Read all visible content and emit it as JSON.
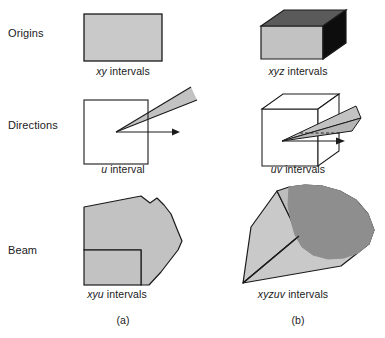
{
  "figure": {
    "width": 385,
    "height": 338,
    "background": "#ffffff"
  },
  "row_labels": [
    {
      "id": "origins",
      "text": "Origins",
      "x": 8,
      "y": 34
    },
    {
      "id": "directions",
      "text": "Directions",
      "x": 8,
      "y": 126
    },
    {
      "id": "beam",
      "text": "Beam",
      "x": 8,
      "y": 251
    }
  ],
  "captions": [
    {
      "id": "xy-intervals",
      "italic": "xy",
      "rest": " intervals",
      "cx": 123,
      "y": 72,
      "row": "origins",
      "column": "a"
    },
    {
      "id": "xyz-intervals",
      "italic": "xyz",
      "rest": " intervals",
      "cx": 298,
      "y": 72,
      "row": "origins",
      "column": "b"
    },
    {
      "id": "u-interval",
      "italic": "u",
      "rest": " interval",
      "cx": 123,
      "y": 170,
      "row": "directions",
      "column": "a"
    },
    {
      "id": "uv-intervals",
      "italic": "uv",
      "rest": " intervals",
      "cx": 298,
      "y": 170,
      "row": "directions",
      "column": "b"
    },
    {
      "id": "xyu-intervals",
      "italic": "xyu",
      "rest": " intervals",
      "cx": 117,
      "y": 295,
      "row": "beam",
      "column": "a"
    },
    {
      "id": "xyzuv-intervals",
      "italic": "xyzuv",
      "rest": " intervals",
      "cx": 293,
      "y": 295,
      "row": "beam",
      "column": "b"
    }
  ],
  "panel_labels": [
    {
      "id": "panel-a",
      "text": "(a)",
      "cx": 123,
      "y": 321
    },
    {
      "id": "panel-b",
      "text": "(b)",
      "cx": 298,
      "y": 321
    }
  ],
  "colors": {
    "fill_light_gray": "#c9c9c9",
    "fill_mid_gray": "#b8b8b8",
    "fill_dark_gray": "#8e8e8e",
    "fill_top_gray": "#5a5a5a",
    "fill_black": "#0d0d0d",
    "fill_white": "#ffffff",
    "stroke": "#1a1a1a",
    "text": "#1a1a1a",
    "background": "#ffffff"
  },
  "shapes": {
    "origins_2d_rect": {
      "name": "xy-interval-rectangle",
      "points": "84,14 162,14 162,61 84,61",
      "fill": "#c9c9c9",
      "stroke": "#1a1a1a"
    },
    "origins_3d_box": {
      "name": "xyz-interval-box",
      "front": "261,26 323,26 323,59 261,59",
      "top": "261,26 284,10 346,10 323,26",
      "side": "323,26 346,10 346,43 323,59",
      "front_fill": "#c2c2c2",
      "top_fill": "#5a5a5a",
      "side_fill": "#0d0d0d"
    },
    "directions_2d": {
      "name": "u-interval-square-with-wedge",
      "square": "84,100 148,100 148,164 84,164",
      "wedge": "116,132 190,88 196,101",
      "arrow_from": [
        116,
        132
      ],
      "arrow_to": [
        178,
        132
      ],
      "square_fill": "#ffffff",
      "wedge_fill": "#c2c2c2"
    },
    "directions_3d": {
      "name": "uv-interval-cube-with-wedge",
      "front": "262,109 318,109 318,166 262,166",
      "top": "262,109 283,94 339,94 318,109",
      "side": "318,109 339,94 339,151 318,166",
      "wedge_upper": "282,140 355,107 360,119",
      "wedge_lower": "282,140 360,119 352,130",
      "arrow_from": [
        282,
        140
      ],
      "arrow_to": [
        344,
        140
      ],
      "cube_fill": "#ffffff",
      "wedge_fill": "#c2c2c2"
    },
    "beam_2d": {
      "name": "xyu-beam",
      "body": "84,250 84,207 141,196 152,204 158,199 165,206 172,215 178,231 182,241 178,249 172,258 160,272 148,284 141,284 141,250",
      "rect": "84,250 141,250 141,284 84,284",
      "fill": "#c2c2c2",
      "stroke": "#1a1a1a"
    },
    "beam_3d": {
      "name": "xyzuv-beam-frustum",
      "top_face": "243,283 251,228 276,192 286,190 300,190 313,193 324,199 331,209 336,222 340,236 342,249 339,258 331,266 367,247 372,238 374,228 371,214 363,202 352,195 338,190 323,186 308,186 296,188 285,192 276,198",
      "left_face": "243,283 251,228 276,192 296,234 243,283",
      "bottom_face": "243,283 296,234 372,238 367,247 339,258 331,266 243,283",
      "cap": "286,190 300,190 313,193 324,199 331,209 336,222 340,236 342,249 339,258 331,266 322,270 310,272 299,271 291,266 285,257 282,247 281,235 283,220 284,204",
      "light_fill": "#c9c9c9",
      "mid_fill": "#bdbdbd",
      "dark_fill": "#8e8e8e",
      "stroke": "#1a1a1a"
    }
  }
}
